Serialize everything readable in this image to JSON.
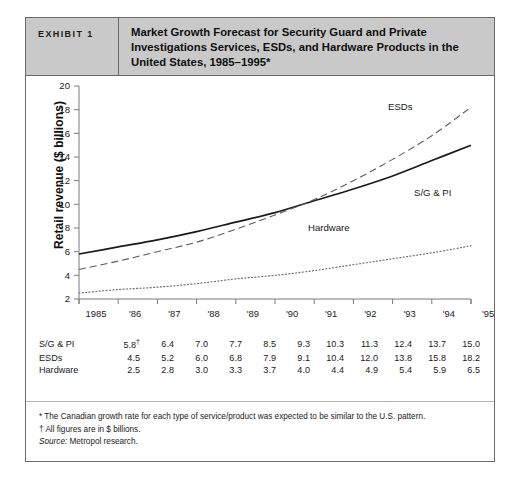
{
  "header": {
    "tag": "EXHIBIT 1",
    "title": "Market Growth Forecast for Security Guard and Private Investigations Services, ESDs, and Hardware Products in the United States, 1985–1995*"
  },
  "chart_data": {
    "type": "line",
    "title": "Market Growth Forecast for Security Guard and Private Investigations Services, ESDs, and Hardware Products in the United States, 1985–1995*",
    "xlabel": "",
    "ylabel": "Retail revenue ($ billions)",
    "categories": [
      "1985",
      "'86",
      "'87",
      "'88",
      "'89",
      "'90",
      "'91",
      "'92",
      "'93",
      "'94",
      "'95"
    ],
    "x": [
      1985,
      1986,
      1987,
      1988,
      1989,
      1990,
      1991,
      1992,
      1993,
      1994,
      1995
    ],
    "ylim": [
      2,
      20
    ],
    "yticks": [
      2,
      4,
      6,
      8,
      10,
      12,
      14,
      16,
      18,
      20
    ],
    "grid": false,
    "legend_position": "inline-labels",
    "series": [
      {
        "name": "S/G & PI",
        "style": "solid",
        "color": "#1a1a1a",
        "values": [
          5.8,
          6.4,
          7.0,
          7.7,
          8.5,
          9.3,
          10.3,
          11.3,
          12.4,
          13.7,
          15.0
        ]
      },
      {
        "name": "ESDs",
        "style": "dashed",
        "color": "#5a5a5a",
        "values": [
          4.5,
          5.2,
          6.0,
          6.8,
          7.9,
          9.1,
          10.4,
          12.0,
          13.8,
          15.8,
          18.2
        ]
      },
      {
        "name": "Hardware",
        "style": "dotted",
        "color": "#6e6e6e",
        "values": [
          2.5,
          2.8,
          3.0,
          3.3,
          3.7,
          4.0,
          4.4,
          4.9,
          5.4,
          5.9,
          6.5
        ]
      }
    ]
  },
  "table": {
    "rows": [
      {
        "name": "S/G & PI",
        "values": [
          "5.8",
          "6.4",
          "7.0",
          "7.7",
          "8.5",
          "9.3",
          "10.3",
          "11.3",
          "12.4",
          "13.7",
          "15.0"
        ],
        "first_marker": "†"
      },
      {
        "name": "ESDs",
        "values": [
          "4.5",
          "5.2",
          "6.0",
          "6.8",
          "7.9",
          "9.1",
          "10.4",
          "12.0",
          "13.8",
          "15.8",
          "18.2"
        ],
        "first_marker": ""
      },
      {
        "name": "Hardware",
        "values": [
          "2.5",
          "2.8",
          "3.0",
          "3.3",
          "3.7",
          "4.0",
          "4.4",
          "4.9",
          "5.4",
          "5.9",
          "6.5"
        ],
        "first_marker": ""
      }
    ]
  },
  "notes": {
    "note1": "* The Canadian growth rate for each type of service/product was expected to be similar to the U.S. pattern.",
    "note2": "† All figures are in $ billions.",
    "source_label": "Source:",
    "source_text": " Metropol research."
  }
}
